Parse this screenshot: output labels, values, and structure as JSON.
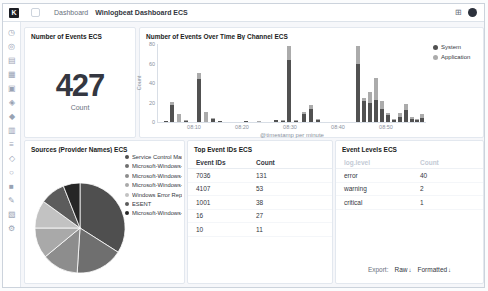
{
  "header": {
    "logo_letter": "K",
    "breadcrumb_root": "Dashboard",
    "breadcrumb_current": "Winlogbeat Dashboard ECS",
    "apps_icon_glyph": "⊞"
  },
  "sidebar": {
    "items": [
      {
        "name": "recently-viewed",
        "glyph": "◷"
      },
      {
        "name": "discover",
        "glyph": "◎"
      },
      {
        "name": "visualize",
        "glyph": "▤"
      },
      {
        "name": "dashboard",
        "glyph": "▦"
      },
      {
        "name": "canvas",
        "glyph": "▣"
      },
      {
        "name": "maps",
        "glyph": "◈"
      },
      {
        "name": "machine-learning",
        "glyph": "◆"
      },
      {
        "name": "infrastructure",
        "glyph": "▥"
      },
      {
        "name": "logs",
        "glyph": "≡"
      },
      {
        "name": "apm",
        "glyph": "◇"
      },
      {
        "name": "uptime",
        "glyph": "○"
      },
      {
        "name": "siem",
        "glyph": "■"
      },
      {
        "name": "dev-tools",
        "glyph": "✎"
      },
      {
        "name": "stack-monitoring",
        "glyph": "▧"
      },
      {
        "name": "management",
        "glyph": "⚙"
      }
    ],
    "collapse_glyph": "◦"
  },
  "panels": {
    "events_count": {
      "title": "Number of Events ECS",
      "value": "427",
      "label": "Count"
    },
    "events_over_time": {
      "title": "Number of Events Over Time By Channel ECS",
      "ylabel": "Count",
      "xlabel": "@timestamp per minute",
      "ymax": 80,
      "yticks": [
        0,
        20,
        40,
        60,
        80
      ],
      "xticks": [
        {
          "label": "08:10",
          "x": 36
        },
        {
          "label": "08:20",
          "x": 84
        },
        {
          "label": "08:30",
          "x": 132
        },
        {
          "label": "08:40",
          "x": 180
        },
        {
          "label": "08:50",
          "x": 228
        }
      ],
      "legend": [
        {
          "label": "System",
          "color": "#515151"
        },
        {
          "label": "Application",
          "color": "#ababab"
        }
      ],
      "bars": [
        {
          "x": 6,
          "system": 1,
          "application": 0
        },
        {
          "x": 12,
          "system": 17,
          "application": 4
        },
        {
          "x": 19,
          "system": 0,
          "application": 8
        },
        {
          "x": 26,
          "system": 1,
          "application": 1
        },
        {
          "x": 39,
          "system": 44,
          "application": 6
        },
        {
          "x": 46,
          "system": 0,
          "application": 10
        },
        {
          "x": 53,
          "system": 3,
          "application": 1
        },
        {
          "x": 60,
          "system": 1,
          "application": 0
        },
        {
          "x": 86,
          "system": 1,
          "application": 0
        },
        {
          "x": 99,
          "system": 0,
          "application": 1
        },
        {
          "x": 116,
          "system": 2,
          "application": 0
        },
        {
          "x": 123,
          "system": 1,
          "application": 1
        },
        {
          "x": 129,
          "system": 64,
          "application": 14
        },
        {
          "x": 136,
          "system": 1,
          "application": 1
        },
        {
          "x": 144,
          "system": 8,
          "application": 2
        },
        {
          "x": 151,
          "system": 13,
          "application": 4
        },
        {
          "x": 158,
          "system": 2,
          "application": 1
        },
        {
          "x": 198,
          "system": 60,
          "application": 18
        },
        {
          "x": 204,
          "system": 22,
          "application": 3
        },
        {
          "x": 210,
          "system": 19,
          "application": 12
        },
        {
          "x": 216,
          "system": 23,
          "application": 22
        },
        {
          "x": 222,
          "system": 13,
          "application": 9
        },
        {
          "x": 228,
          "system": 7,
          "application": 2
        },
        {
          "x": 234,
          "system": 2,
          "application": 1
        },
        {
          "x": 240,
          "system": 5,
          "application": 4
        },
        {
          "x": 246,
          "system": 12,
          "application": 7
        },
        {
          "x": 252,
          "system": 3,
          "application": 2
        },
        {
          "x": 257,
          "system": 2,
          "application": 1
        },
        {
          "x": 262,
          "system": 4,
          "application": 4
        }
      ]
    },
    "sources": {
      "title": "Sources (Provider Names) ECS",
      "slices": [
        {
          "label": "Service Control Man...",
          "value": 34,
          "color": "#4f4f4f"
        },
        {
          "label": "Microsoft-Windows-...",
          "value": 17,
          "color": "#6f6f6f"
        },
        {
          "label": "Microsoft-Windows-...",
          "value": 13,
          "color": "#8d8d8d"
        },
        {
          "label": "Microsoft-Windows-...",
          "value": 11,
          "color": "#a9a9a9"
        },
        {
          "label": "Windows Error Repo...",
          "value": 10,
          "color": "#c2c2c2"
        },
        {
          "label": "ESENT",
          "value": 9,
          "color": "#5c5c5c"
        },
        {
          "label": "Microsoft-Windows-...",
          "value": 6,
          "color": "#262626"
        }
      ]
    },
    "top_event_ids": {
      "title": "Top Event IDs ECS",
      "columns": [
        "Event IDs",
        "Count"
      ],
      "rows": [
        [
          "7036",
          "131"
        ],
        [
          "4107",
          "53"
        ],
        [
          "1001",
          "38"
        ],
        [
          "16",
          "27"
        ],
        [
          "10",
          "11"
        ]
      ]
    },
    "event_levels": {
      "title": "Event Levels ECS",
      "columns": [
        "log.level",
        "Count"
      ],
      "rows": [
        [
          "error",
          "40"
        ],
        [
          "warning",
          "2"
        ],
        [
          "critical",
          "1"
        ]
      ],
      "export": {
        "label": "Export:",
        "raw": "Raw",
        "formatted": "Formatted",
        "download_glyph": "↓"
      }
    }
  }
}
